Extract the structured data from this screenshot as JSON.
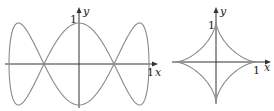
{
  "figures": [
    {
      "name": "lissajous-curve",
      "curve": "x = sin(t), y = cos(3t)",
      "labels": {
        "x_axis": "x",
        "y_axis": "y",
        "x_tick": "1",
        "y_tick": "1"
      }
    },
    {
      "name": "astroid",
      "curve": "x = cos^3(t), y = sin^3(t)",
      "labels": {
        "x_axis": "x",
        "y_axis": "y",
        "x_tick": "1",
        "y_tick": "1"
      }
    }
  ],
  "colors": {
    "curve": "#8a8a8a",
    "axis": "#333333"
  }
}
